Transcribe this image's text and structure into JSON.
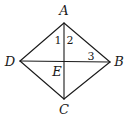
{
  "figure": {
    "type": "quadrilateral-with-diagonals",
    "stroke_color": "#1a1a1a",
    "background_color": "#ffffff",
    "points": {
      "A": {
        "x": 64,
        "y": 23,
        "label": "A",
        "label_x": 64,
        "label_y": 15
      },
      "B": {
        "x": 110,
        "y": 62,
        "label": "B",
        "label_x": 119,
        "label_y": 66
      },
      "C": {
        "x": 64,
        "y": 99,
        "label": "C",
        "label_x": 64,
        "label_y": 114
      },
      "D": {
        "x": 20,
        "y": 61,
        "label": "D",
        "label_x": 10,
        "label_y": 66
      },
      "E": {
        "x": 64,
        "y": 61,
        "label": "E",
        "label_x": 57,
        "label_y": 76
      }
    },
    "segments": [
      [
        "A",
        "B"
      ],
      [
        "B",
        "C"
      ],
      [
        "C",
        "D"
      ],
      [
        "D",
        "A"
      ],
      [
        "A",
        "C"
      ],
      [
        "D",
        "B"
      ]
    ],
    "angle_labels": [
      {
        "label": "1",
        "x": 58,
        "y": 44
      },
      {
        "label": "2",
        "x": 70,
        "y": 44
      },
      {
        "label": "3",
        "x": 91,
        "y": 60
      }
    ]
  }
}
